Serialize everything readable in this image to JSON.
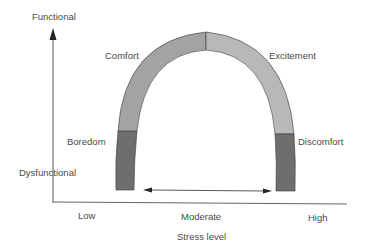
{
  "diagram": {
    "title": "",
    "y_axis": {
      "top_label": "Functional",
      "bottom_label": "Dysfunctional"
    },
    "x_axis": {
      "title": "Stress level",
      "ticks": [
        "Low",
        "Moderate",
        "High"
      ]
    },
    "curve_segments": [
      {
        "label": "Boredom",
        "position": "left-lower",
        "shade": "dark"
      },
      {
        "label": "Comfort",
        "position": "left-upper",
        "shade": "medium"
      },
      {
        "label": "Excitement",
        "position": "right-upper",
        "shade": "light"
      },
      {
        "label": "Discomfort",
        "position": "right-lower",
        "shade": "dark"
      }
    ],
    "optimal_range_arrow": "double-headed arrow spanning moderate stress",
    "colors": {
      "dark_segment": "#6e6e6e",
      "medium_segment": "#a3a3a3",
      "light_segment": "#b8b8b8",
      "outline": "#3a3a3a",
      "axis": "#555555",
      "text": "#4a4a4a"
    }
  }
}
